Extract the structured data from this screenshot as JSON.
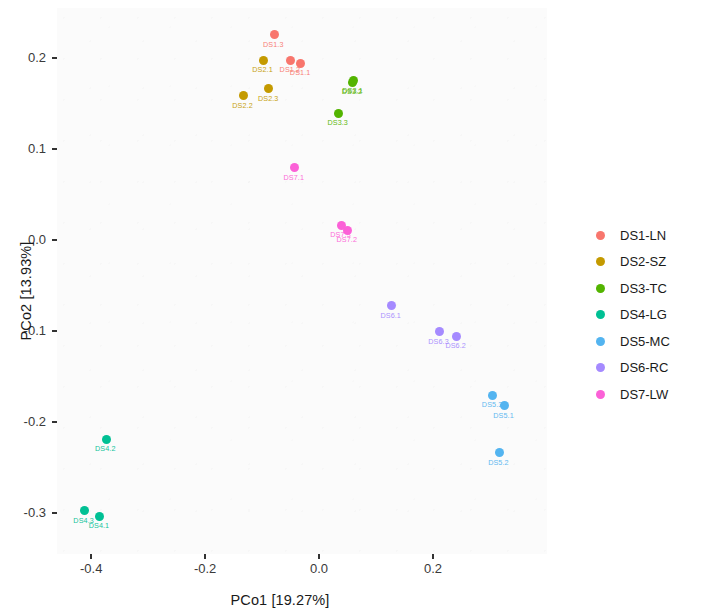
{
  "chart_data": {
    "type": "scatter",
    "title": "",
    "xlabel": "PCo1 [19.27%]",
    "ylabel": "PCo2 [13.93%]",
    "xlim": [
      -0.46,
      0.4
    ],
    "ylim": [
      -0.345,
      0.255
    ],
    "xticks": [
      "-0.4",
      "-0.2",
      "0.0",
      "0.2"
    ],
    "xtick_values": [
      -0.4,
      -0.2,
      0.0,
      0.2
    ],
    "yticks": [
      "0.2",
      "0.1",
      "0.0",
      "-0.1",
      "-0.2",
      "-0.3"
    ],
    "ytick_values": [
      0.2,
      0.1,
      0.0,
      -0.1,
      -0.2,
      -0.3
    ],
    "grid": false,
    "legend_position": "right",
    "series": [
      {
        "name": "DS1-LN",
        "color": "#F8766D",
        "points": [
          {
            "label": "DS1.3",
            "x": -0.079,
            "y": 0.2255
          },
          {
            "label": "DS1.2",
            "x": -0.05,
            "y": 0.1975
          },
          {
            "label": "DS1.1",
            "x": -0.032,
            "y": 0.1945
          }
        ]
      },
      {
        "name": "DS2-SZ",
        "color": "#C49A00",
        "points": [
          {
            "label": "DS2.1",
            "x": -0.098,
            "y": 0.1975
          },
          {
            "label": "DS2.3",
            "x": -0.088,
            "y": 0.1665
          },
          {
            "label": "DS2.2",
            "x": -0.133,
            "y": 0.1585
          }
        ]
      },
      {
        "name": "DS3-TC",
        "color": "#53B400",
        "points": [
          {
            "label": "DS3.1",
            "x": 0.06,
            "y": 0.175
          },
          {
            "label": "DS3.2",
            "x": 0.059,
            "y": 0.1735
          },
          {
            "label": "DS3.3",
            "x": 0.034,
            "y": 0.1395
          }
        ]
      },
      {
        "name": "DS4-LG",
        "color": "#00C094",
        "points": [
          {
            "label": "DS4.2",
            "x": -0.374,
            "y": -0.219
          },
          {
            "label": "DS4.3",
            "x": -0.412,
            "y": -0.2975
          },
          {
            "label": "DS4.1",
            "x": -0.385,
            "y": -0.3035
          }
        ]
      },
      {
        "name": "DS5-MC",
        "color": "#53B4F0",
        "points": [
          {
            "label": "DS5.3",
            "x": 0.305,
            "y": -0.1705
          },
          {
            "label": "DS5.1",
            "x": 0.325,
            "y": -0.182
          },
          {
            "label": "DS5.2",
            "x": 0.316,
            "y": -0.2335
          }
        ]
      },
      {
        "name": "DS6-RC",
        "color": "#A58AFF",
        "points": [
          {
            "label": "DS6.1",
            "x": 0.127,
            "y": -0.072
          },
          {
            "label": "DS6.3",
            "x": 0.211,
            "y": -0.1005
          },
          {
            "label": "DS6.2",
            "x": 0.241,
            "y": -0.1055
          }
        ]
      },
      {
        "name": "DS7-LW",
        "color": "#FB61D7",
        "points": [
          {
            "label": "DS7.1",
            "x": -0.043,
            "y": 0.0795
          },
          {
            "label": "DS7.3",
            "x": 0.039,
            "y": 0.016
          },
          {
            "label": "DS7.2",
            "x": 0.05,
            "y": 0.011
          }
        ]
      }
    ]
  }
}
